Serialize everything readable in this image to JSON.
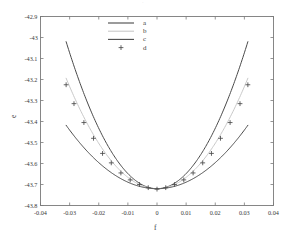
{
  "figure": {
    "top_faint_mark": "·",
    "bg_color": "#ffffff",
    "axis_color": "#7a7a7a",
    "text_color": "#3b3b3b"
  },
  "axes": {
    "xlabel": "f",
    "ylabel": "e",
    "x_ticks": [
      "-0.04",
      "-0.03",
      "-0.02",
      "-0.01",
      "0",
      "0.01",
      "0.02",
      "0.03",
      "0.04"
    ],
    "y_ticks": [
      "-42.9",
      "-43",
      "-43.1",
      "-43.2",
      "-43.3",
      "-43.4",
      "-43.5",
      "-43.6",
      "-43.7",
      "-43.8"
    ]
  },
  "legend": {
    "entries": [
      {
        "label": "a",
        "type": "line",
        "color": "#4a4a4a"
      },
      {
        "label": "b",
        "type": "line",
        "color": "#c9c9c9"
      },
      {
        "label": "c",
        "type": "line",
        "color": "#4a4a4a"
      },
      {
        "label": "d",
        "type": "marker",
        "color": "#4a4a4a",
        "marker": "plus-marker"
      }
    ]
  },
  "chart_data": {
    "type": "line",
    "title": "",
    "xlabel": "f",
    "ylabel": "e",
    "xlim": [
      -0.04,
      0.04
    ],
    "ylim": [
      -43.8,
      -42.9
    ],
    "xticks": [
      -0.04,
      -0.03,
      -0.02,
      -0.01,
      0,
      0.01,
      0.02,
      0.03,
      0.04
    ],
    "yticks": [
      -42.9,
      -43.0,
      -43.1,
      -43.2,
      -43.3,
      -43.4,
      -43.5,
      -43.6,
      -43.7,
      -43.8
    ],
    "grid": false,
    "legend_position": "upper-center",
    "series": [
      {
        "name": "a",
        "type": "line",
        "color": "#4a4a4a",
        "linewidth": 1.0,
        "comment": "steepest parabola, e = -43.72 + 720*f^2",
        "x": [
          -0.0312,
          -0.028,
          -0.024,
          -0.02,
          -0.016,
          -0.012,
          -0.008,
          -0.004,
          0.0,
          0.004,
          0.008,
          0.012,
          0.016,
          0.02,
          0.024,
          0.028,
          0.0312
        ],
        "y": [
          -43.02,
          -43.156,
          -43.305,
          -43.432,
          -43.536,
          -43.616,
          -43.674,
          -43.708,
          -43.72,
          -43.708,
          -43.674,
          -43.616,
          -43.536,
          -43.432,
          -43.305,
          -43.156,
          -43.02
        ]
      },
      {
        "name": "b",
        "type": "line",
        "color": "#c9c9c9",
        "linewidth": 1.0,
        "comment": "middle parabola, e = -43.72 + 540*f^2",
        "x": [
          -0.0312,
          -0.028,
          -0.024,
          -0.02,
          -0.016,
          -0.012,
          -0.008,
          -0.004,
          0.0,
          0.004,
          0.008,
          0.012,
          0.016,
          0.02,
          0.024,
          0.028,
          0.0312
        ],
        "y": [
          -43.194,
          -43.297,
          -43.409,
          -43.504,
          -43.582,
          -43.642,
          -43.685,
          -43.711,
          -43.72,
          -43.711,
          -43.685,
          -43.642,
          -43.582,
          -43.504,
          -43.409,
          -43.297,
          -43.194
        ]
      },
      {
        "name": "c",
        "type": "line",
        "color": "#4a4a4a",
        "linewidth": 1.0,
        "comment": "shallowest parabola, e = -43.72 + 310*f^2",
        "x": [
          -0.0312,
          -0.028,
          -0.024,
          -0.02,
          -0.016,
          -0.012,
          -0.008,
          -0.004,
          0.0,
          0.004,
          0.008,
          0.012,
          0.016,
          0.02,
          0.024,
          0.028,
          0.0312
        ],
        "y": [
          -43.418,
          -43.477,
          -43.541,
          -43.596,
          -43.641,
          -43.675,
          -43.7,
          -43.715,
          -43.72,
          -43.715,
          -43.7,
          -43.675,
          -43.641,
          -43.596,
          -43.541,
          -43.477,
          -43.418
        ]
      },
      {
        "name": "d",
        "type": "scatter",
        "marker": "plus-marker",
        "color": "#4a4a4a",
        "x": [
          -0.0312,
          -0.0285,
          -0.0251,
          -0.0218,
          -0.0187,
          -0.0157,
          -0.0124,
          -0.0092,
          -0.006,
          -0.003,
          0.0,
          0.003,
          0.006,
          0.0092,
          0.0124,
          0.0157,
          0.0187,
          0.0218,
          0.0251,
          0.0285,
          0.0312
        ],
        "y": [
          -43.225,
          -43.315,
          -43.405,
          -43.48,
          -43.552,
          -43.597,
          -43.645,
          -43.678,
          -43.7,
          -43.715,
          -43.722,
          -43.715,
          -43.7,
          -43.678,
          -43.645,
          -43.597,
          -43.552,
          -43.48,
          -43.405,
          -43.315,
          -43.225
        ]
      }
    ]
  }
}
